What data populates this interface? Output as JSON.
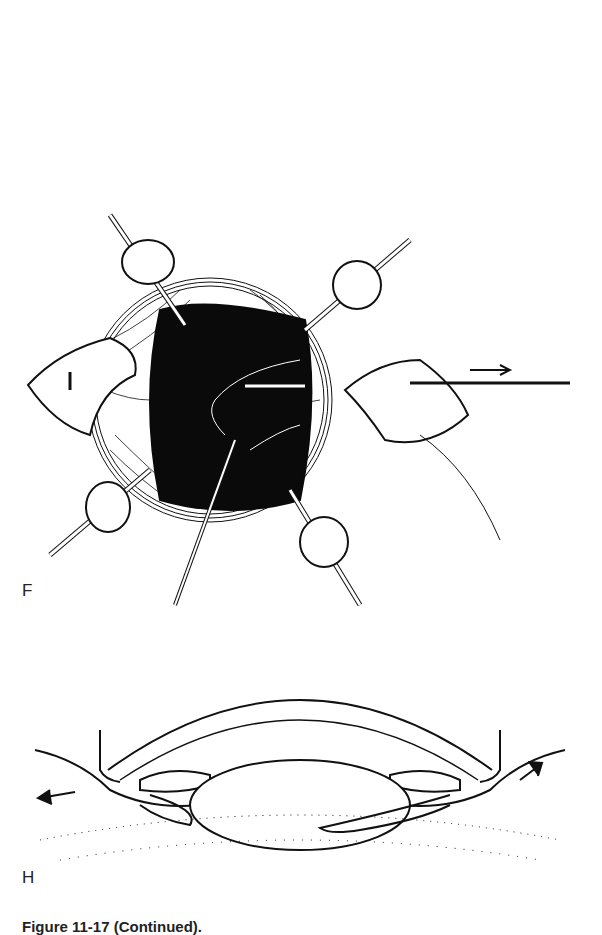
{
  "page": {
    "background": "#ffffff",
    "ink_color": "#111111"
  },
  "figures": [
    {
      "label": "F",
      "description": "Surgical view of eye with four retraction sutures/clamps, two scleral flaps reflected, black dilated pupil, instrument entering from below, needle withdrawn to the right with arrow"
    },
    {
      "label": "H",
      "description": "Cross-section of anterior eye showing cornea arc, iris, lens, ciliary body, with outward arrows at both limbal incisions"
    }
  ],
  "caption": {
    "text": "Figure 11-17 (Continued)."
  }
}
